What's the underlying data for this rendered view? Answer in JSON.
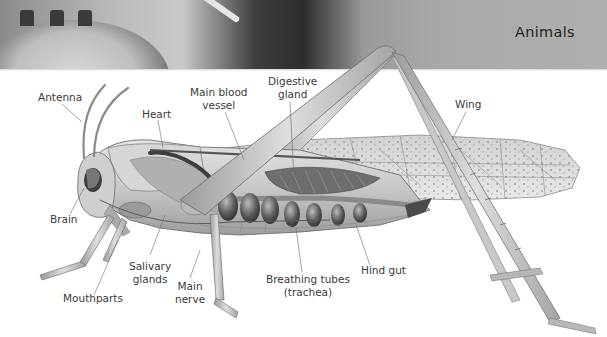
{
  "header": {
    "title": "Animals"
  },
  "diagram": {
    "labels": {
      "antenna": "Antenna",
      "heart": "Heart",
      "main_blood_vessel_line1": "Main blood",
      "main_blood_vessel_line2": "vessel",
      "digestive_gland_line1": "Digestive",
      "digestive_gland_line2": "gland",
      "wing": "Wing",
      "brain": "Brain",
      "salivary_glands_line1": "Salivary",
      "salivary_glands_line2": "glands",
      "mouthparts": "Mouthparts",
      "main_nerve_line1": "Main",
      "main_nerve_line2": "nerve",
      "breathing_tubes_line1": "Breathing tubes",
      "breathing_tubes_line2": "(trachea)",
      "hind_gut": "Hind gut"
    },
    "colors": {
      "label_text": "#3a3a3a",
      "leader_line": "#6a6a6a",
      "header_band": "#a8a8a8"
    }
  }
}
